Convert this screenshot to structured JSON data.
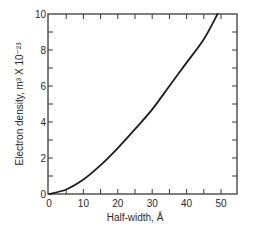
{
  "chart_data": {
    "type": "line",
    "title": "",
    "xlabel": "Half-width, Å",
    "ylabel": "Electron density, m³ X 10⁻²³",
    "xlim": [
      0,
      50
    ],
    "ylim": [
      0,
      10
    ],
    "x_ticks": [
      0,
      10,
      20,
      30,
      40,
      50
    ],
    "x_tick_labels": [
      "0",
      "10",
      "20",
      "30",
      "40",
      "50"
    ],
    "y_ticks": [
      0,
      2,
      4,
      6,
      8,
      10
    ],
    "y_tick_labels": [
      "0",
      "2",
      "4",
      "6",
      "8",
      "10"
    ],
    "grid": false,
    "legend": null,
    "series": [
      {
        "name": "Electron density vs half-width",
        "x": [
          0,
          5,
          10,
          15,
          20,
          25,
          30,
          35,
          40,
          45,
          49
        ],
        "y": [
          0,
          0.25,
          0.8,
          1.6,
          2.55,
          3.6,
          4.7,
          6.0,
          7.3,
          8.6,
          10.0
        ]
      }
    ]
  },
  "style": {
    "line_color": "#1e1e1e",
    "axis_color": "#3a3a3a",
    "text_color": "#2a2a2a"
  }
}
